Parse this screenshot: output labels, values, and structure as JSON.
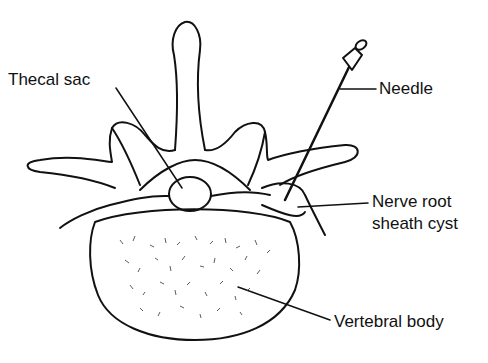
{
  "diagram": {
    "colors": {
      "line": "#111111",
      "background": "#ffffff"
    },
    "labels": [
      {
        "id": "thecal-sac",
        "text": "Thecal sac"
      },
      {
        "id": "needle",
        "text": "Needle"
      },
      {
        "id": "nerve-root-sheath-cyst",
        "text": "Nerve root sheath cyst",
        "lines": [
          "Nerve root",
          "sheath cyst"
        ]
      },
      {
        "id": "vertebral-body",
        "text": "Vertebral body"
      }
    ]
  }
}
